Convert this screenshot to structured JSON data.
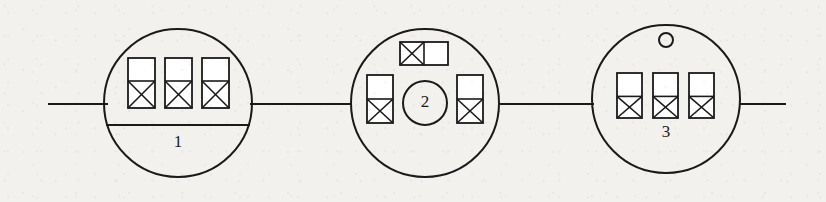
{
  "diagram": {
    "type": "schematic-diagram",
    "background_color": "#f2f1ee",
    "stroke_color": "#1a1a1a",
    "fill_color": "#ffffff",
    "width": 826,
    "height": 202,
    "baseline_y": 104,
    "lines": [
      {
        "name": "line-left-lead",
        "x1": 48,
        "y1": 104,
        "x2": 108,
        "y2": 104
      },
      {
        "name": "line-node1-node2",
        "x1": 250,
        "y1": 104,
        "x2": 352,
        "y2": 104
      },
      {
        "name": "line-node2-node3",
        "x1": 500,
        "y1": 104,
        "x2": 594,
        "y2": 104
      },
      {
        "name": "line-right-lead",
        "x1": 740,
        "y1": 104,
        "x2": 786,
        "y2": 104
      }
    ],
    "nodes": [
      {
        "id": "node-1",
        "label": "1",
        "label_x": 178,
        "label_y": 143,
        "cx": 178,
        "cy": 103,
        "r": 74,
        "chord": {
          "x1": 106,
          "y1": 125,
          "x2": 250,
          "y2": 125
        },
        "inner_circle": null,
        "small_circle": null,
        "boxes": [
          {
            "name": "box-1-a",
            "orientation": "vertical",
            "x": 128,
            "y": 58,
            "w": 27,
            "h": 50,
            "split": 0.46,
            "cells": [
              "empty",
              "crossed"
            ]
          },
          {
            "name": "box-1-b",
            "orientation": "vertical",
            "x": 165,
            "y": 58,
            "w": 27,
            "h": 50,
            "split": 0.46,
            "cells": [
              "empty",
              "crossed"
            ]
          },
          {
            "name": "box-1-c",
            "orientation": "vertical",
            "x": 202,
            "y": 58,
            "w": 27,
            "h": 50,
            "split": 0.46,
            "cells": [
              "empty",
              "crossed"
            ]
          }
        ]
      },
      {
        "id": "node-2",
        "label": "2",
        "label_x": 425,
        "label_y": 103,
        "cx": 425,
        "cy": 103,
        "r": 74,
        "chord": null,
        "inner_circle": {
          "name": "inner-circle-node2",
          "cx": 425,
          "cy": 103,
          "r": 22
        },
        "small_circle": null,
        "boxes": [
          {
            "name": "box-2-top",
            "orientation": "horizontal",
            "x": 400,
            "y": 42,
            "w": 48,
            "h": 23,
            "split": 0.5,
            "cells": [
              "crossed",
              "empty"
            ]
          },
          {
            "name": "box-2-left",
            "orientation": "vertical",
            "x": 367,
            "y": 75,
            "w": 26,
            "h": 48,
            "split": 0.5,
            "cells": [
              "empty",
              "crossed"
            ]
          },
          {
            "name": "box-2-right",
            "orientation": "vertical",
            "x": 457,
            "y": 75,
            "w": 26,
            "h": 48,
            "split": 0.5,
            "cells": [
              "empty",
              "crossed"
            ]
          }
        ]
      },
      {
        "id": "node-3",
        "label": "3",
        "label_x": 666,
        "label_y": 133,
        "cx": 666,
        "cy": 99,
        "r": 74,
        "chord": null,
        "inner_circle": null,
        "small_circle": {
          "name": "small-circle-node3",
          "cx": 666,
          "cy": 40,
          "r": 7
        },
        "boxes": [
          {
            "name": "box-3-a",
            "orientation": "vertical",
            "x": 617,
            "y": 73,
            "w": 25,
            "h": 45,
            "split": 0.52,
            "cells": [
              "empty",
              "crossed"
            ]
          },
          {
            "name": "box-3-b",
            "orientation": "vertical",
            "x": 653,
            "y": 73,
            "w": 25,
            "h": 45,
            "split": 0.52,
            "cells": [
              "empty",
              "crossed"
            ]
          },
          {
            "name": "box-3-c",
            "orientation": "vertical",
            "x": 689,
            "y": 73,
            "w": 25,
            "h": 45,
            "split": 0.52,
            "cells": [
              "empty",
              "crossed"
            ]
          }
        ]
      }
    ]
  }
}
